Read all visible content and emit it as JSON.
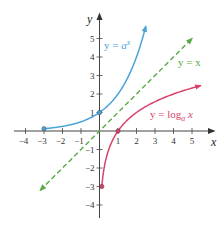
{
  "chart_data": {
    "type": "line",
    "title": "",
    "xlabel": "x",
    "ylabel": "y",
    "xlim": [
      -4.5,
      5.5
    ],
    "ylim": [
      -4.5,
      5.5
    ],
    "grid": false,
    "x_ticks": [
      -4,
      -3,
      -2,
      -1,
      1,
      2,
      3,
      4,
      5
    ],
    "y_ticks": [
      -4,
      -3,
      -2,
      -1,
      1,
      2,
      3,
      4,
      5
    ],
    "x_tick_labels": [
      "−4",
      "−3",
      "−2",
      "−1",
      "1",
      "2",
      "3",
      "4",
      "5"
    ],
    "y_tick_labels": [
      "−4",
      "−3",
      "−2",
      "−1",
      "1",
      "2",
      "3",
      "4",
      "5"
    ],
    "series": [
      {
        "name": "y = a^x",
        "label_prefix": "y = ",
        "label_base": "a",
        "label_sup": "x",
        "color": "#4aa3d8",
        "style": "solid",
        "marked_points": [
          [
            -3,
            0.125
          ],
          [
            0,
            1
          ]
        ],
        "x": [
          -3,
          -2,
          -1,
          0,
          1,
          1.5,
          2,
          2.5
        ],
        "y": [
          0.125,
          0.25,
          0.5,
          1,
          2,
          2.83,
          4,
          5.66
        ]
      },
      {
        "name": "y = x",
        "label": "y = x",
        "color": "#5aa845",
        "style": "dashed",
        "x": [
          -3.2,
          5.0
        ],
        "y": [
          -3.2,
          5.0
        ]
      },
      {
        "name": "y = log_a x",
        "label_prefix": "y = log",
        "label_sub": "a",
        "label_suffix": " x",
        "color": "#d9436a",
        "style": "solid",
        "marked_points": [
          [
            0.125,
            -3
          ],
          [
            1,
            0
          ]
        ],
        "x": [
          0.125,
          0.25,
          0.5,
          1,
          2,
          3,
          4,
          5.5
        ],
        "y": [
          -3,
          -2,
          -1,
          0,
          1,
          1.58,
          2,
          2.46
        ]
      }
    ]
  }
}
